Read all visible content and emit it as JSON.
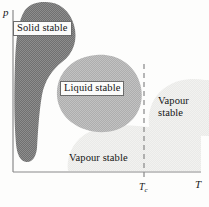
{
  "figure": {
    "kind": "phase-diagram",
    "background_color": "#fdfdfc"
  },
  "axes": {
    "y_label": "p",
    "x_label": "T",
    "origin_x": 13,
    "origin_y": 172,
    "x_end": 201,
    "y_top": 10,
    "axis_color": "#8a8a8a"
  },
  "ticks": {
    "critical": {
      "symbol": "T",
      "subscript": "c",
      "x": 144,
      "line_style": "dashed",
      "line_color": "#7d7d7d"
    }
  },
  "regions": [
    {
      "id": "solid",
      "label": "Solid stable",
      "fill": "#777777",
      "label_boxed": true
    },
    {
      "id": "liquid",
      "label": "Liquid stable",
      "fill": "#b2b2b2",
      "label_boxed": true
    },
    {
      "id": "vapour-bottom",
      "label": "Vapour stable",
      "fill": "#ececea",
      "label_boxed": false
    },
    {
      "id": "vapour-right",
      "label_line1": "Vapour",
      "label_line2": "stable",
      "fill": "#ededeb",
      "label_boxed": false
    }
  ]
}
